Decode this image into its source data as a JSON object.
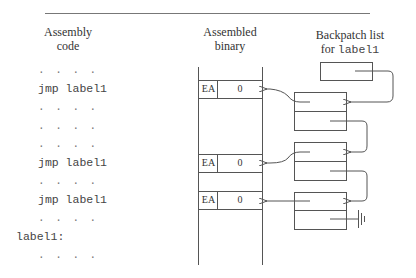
{
  "headers": {
    "assembly_line1": "Assembly",
    "assembly_line2": "code",
    "binary_line1": "Assembled",
    "binary_line2": "binary",
    "backpatch_line1": "Backpatch list",
    "backpatch_for": "for",
    "backpatch_label": "label1"
  },
  "code_lines": [
    ". . . .",
    "jmp label1",
    ". . . .",
    ". . . .",
    ". . . .",
    "jmp label1",
    ". . . .",
    "jmp label1",
    ". . . .",
    "label1:",
    ". . . ."
  ],
  "binary_rows": [
    {
      "opcode": "EA",
      "operand": "0"
    },
    {
      "opcode": "EA",
      "operand": "0"
    },
    {
      "opcode": "EA",
      "operand": "0"
    }
  ],
  "colors": {
    "line": "#555555",
    "text": "#333333"
  }
}
